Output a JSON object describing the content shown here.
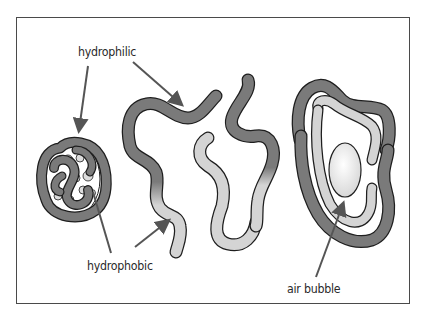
{
  "diagram": {
    "type": "protein-folding-illustration",
    "labels": {
      "hydrophilic": "hydrophilic",
      "hydrophobic": "hydrophobic",
      "air_bubble": "air bubble"
    },
    "panels": [
      {
        "id": "folded-protein",
        "description": "compact globular folded protein chain"
      },
      {
        "id": "unfolded-chains",
        "description": "two unfolded protein strands with dark hydrophilic and light hydrophobic segments"
      },
      {
        "id": "bubble-wrapped-protein",
        "description": "protein strands wrapped around an air bubble, hydrophobic side facing bubble"
      }
    ],
    "colors": {
      "hydrophilic_fill": "#7a7a7a",
      "hydrophobic_fill": "#d4d4d4",
      "outline": "#1e1e1e",
      "arrow": "#555555",
      "bubble": "#efefef",
      "frame": "#4a4a4a"
    }
  }
}
